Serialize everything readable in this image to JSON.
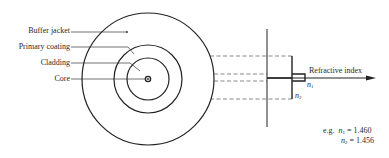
{
  "diagram": {
    "layers": [
      {
        "label": "Buffer jacket"
      },
      {
        "label": "Primary coating"
      },
      {
        "label": "Cladding"
      },
      {
        "label": "Core"
      }
    ],
    "profile": {
      "axis_label": "Refractive index",
      "n1_symbol": "n",
      "n1_sub": "1",
      "n2_symbol": "n",
      "n2_sub": "2"
    },
    "example": {
      "prefix": "e.g.",
      "n1_symbol": "n",
      "n1_sub": "1",
      "n1_value": "= 1.460",
      "n2_symbol": "n",
      "n2_sub": "2",
      "n2_value": "= 1.456"
    },
    "colors": {
      "line": "#222222",
      "dash": "#555555",
      "text": "#2a2a2a",
      "background": "#ffffff"
    }
  }
}
